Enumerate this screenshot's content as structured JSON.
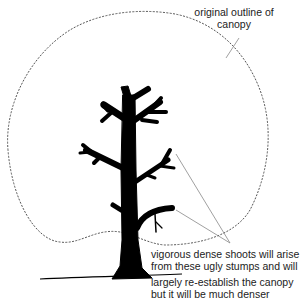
{
  "labels": {
    "outline_line1": "original outline of",
    "outline_line2": "canopy",
    "shoots_line1": "vigorous dense shoots will arise",
    "shoots_line2": "from these ugly stumps and will",
    "shoots_line3": "largely re-establish the canopy",
    "shoots_line4": "but it will be much denser"
  },
  "colors": {
    "tree": "#000000",
    "outline": "#555555",
    "leader": "#888888",
    "text": "#222222"
  }
}
